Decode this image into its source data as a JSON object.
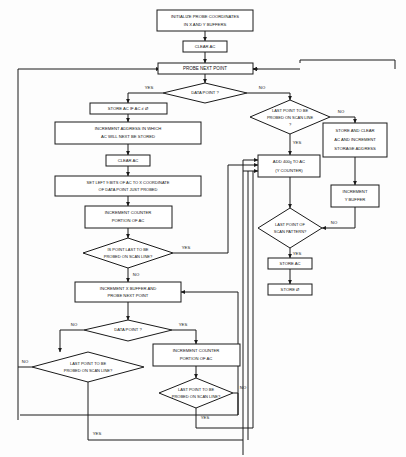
{
  "diagram": {
    "type": "flowchart",
    "line_color": "#1a1a1a",
    "background_color": "#fdfdfd"
  },
  "nodes": {
    "initialize": {
      "line1": "INITIALIZE PROBE COORDINATES",
      "line2": "IN X AND Y BUFFERS"
    },
    "clear_ac_top": {
      "line1": "CLEAR AC"
    },
    "probe_next_point": {
      "line1": "PROBE NEXT POINT"
    },
    "data_point_q_top": {
      "line1": "DATA POINT ?"
    },
    "store_ac_if": {
      "line1": "STORE AC IF AC ≠ Ø"
    },
    "increment_address": {
      "line1": "INCREMENT ADDRESS IN WHICH",
      "line2": "AC WILL NEXT BE STORED"
    },
    "clear_ac_mid": {
      "line1": "CLEAR AC"
    },
    "set_left_bits": {
      "line1": "SET LEFT 9 BITS OF AC TO X COORDINATE",
      "line2": "OF DATA POINT JUST PROBED"
    },
    "increment_counter_mid": {
      "line1": "INCREMENT COUNTER",
      "line2": "PORTION OF AC"
    },
    "is_point_last_q": {
      "line1": "IS POINT LAST TO BE",
      "line2": "PROBED ON SCAN LINE?"
    },
    "increment_x_buffer": {
      "line1": "INCREMENT X BUFFER AND",
      "line2": "PROBE NEXT POINT"
    },
    "data_point_q_bottom": {
      "line1": "DATA POINT ?"
    },
    "last_point_scanline_left": {
      "line1": "LAST POINT TO BE",
      "line2": "PROBED ON SCAN LINE?"
    },
    "increment_counter_bottom": {
      "line1": "INCREMENT COUNTER",
      "line2": "PORTION OF AC"
    },
    "last_point_scanline_bottom": {
      "line1": "LAST POINT TO BE",
      "line2": "PROBED ON SCAN LINE?"
    },
    "last_point_scanline_right": {
      "line1": "LAST POINT TO BE",
      "line2": "PROBED ON SCAN LINE",
      "line3": "?"
    },
    "store_and_clear": {
      "line1": "STORE AND CLEAR",
      "line2": "AC AND INCREMENT",
      "line3": "STORAGE ADDRESS"
    },
    "increment_y_buffer": {
      "line1": "INCREMENT",
      "line2": "Y BUFFER"
    },
    "add_to_ac": {
      "line1_pre": "ADD ",
      "line1_val": "400",
      "line1_sub": "8",
      "line1_post": " TO AC",
      "line2": "(Y COUNTER)"
    },
    "last_point_pattern_q": {
      "line1": "LAST POINT OF",
      "line2": "SCAN PATTERN?"
    },
    "store_ac": {
      "line1": "STORE AC"
    },
    "store_zero": {
      "line1": "STORE Ø"
    }
  },
  "edge_labels": {
    "yes_top_left": "YES",
    "no_top_right": "NO",
    "no_right_outer": "NO",
    "yes_right_inner": "YES",
    "yes_mid_right": "YES",
    "no_mid_down": "NO",
    "no_pattern_right": "NO",
    "yes_pattern_down": "YES",
    "no_bottom_left": "NO",
    "yes_bottom_right": "YES",
    "no_far_left": "NO",
    "yes_far_left_bottom": "YES",
    "no_bottom_inner": "NO",
    "yes_bottom_inner": "YES"
  }
}
